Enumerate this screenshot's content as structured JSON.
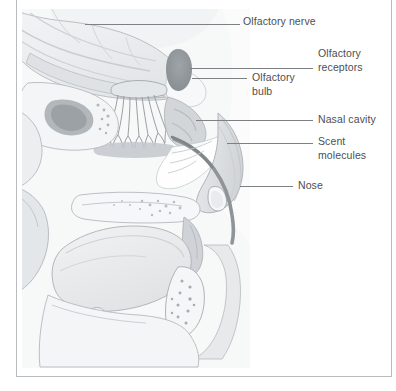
{
  "figure": {
    "frame_color": "#b9bcbe",
    "background_color": "#ffffff",
    "label_color": "#4c4f52",
    "leader_color": "#7d8184"
  },
  "labels": [
    {
      "id": "olfactory-nerve",
      "name": "olfactory-nerve",
      "lines": [
        "Olfactory nerve"
      ],
      "x": 243,
      "y": 15,
      "leader": {
        "x": 85,
        "y": 24,
        "width": 155
      }
    },
    {
      "id": "olfactory-receptors",
      "name": "olfactory-receptors",
      "lines": [
        "Olfactory",
        "receptors"
      ],
      "x": 318,
      "y": 47,
      "leader": {
        "x": 190,
        "y": 68,
        "width": 123
      }
    },
    {
      "id": "olfactory-bulb",
      "name": "olfactory-bulb",
      "lines": [
        "Olfactory",
        "bulb"
      ],
      "x": 252,
      "y": 71,
      "leader": {
        "x": 192,
        "y": 78,
        "width": 55
      }
    },
    {
      "id": "nasal-cavity",
      "name": "nasal-cavity",
      "lines": [
        "Nasal cavity"
      ],
      "x": 318,
      "y": 113,
      "leader": {
        "x": 196,
        "y": 120,
        "width": 117
      }
    },
    {
      "id": "scent-molecules",
      "name": "scent-molecules",
      "lines": [
        "Scent",
        "molecules"
      ],
      "x": 318,
      "y": 135,
      "leader": {
        "x": 227,
        "y": 143,
        "width": 86
      }
    },
    {
      "id": "nose",
      "name": "nose",
      "lines": [
        "Nose"
      ],
      "x": 298,
      "y": 179,
      "leader": {
        "x": 240,
        "y": 186,
        "width": 53
      }
    }
  ],
  "anatomy": {
    "palette": {
      "brain": "#eceef0",
      "brain_shade": "#d6d9dc",
      "bone": "#f4f5f6",
      "bone_shade": "#dcdfe2",
      "cavity": "#ffffff",
      "mucosa": "#c7cbce",
      "mucosa_dark": "#a9aeb2",
      "sinus_dark": "#8c9296",
      "tongue": "#e6e8ea",
      "outline": "#a7acb0",
      "soft_tissue": "#d9dcdf",
      "skin": "#e3e5e7"
    },
    "structures": [
      "cerebrum",
      "corpus-callosum",
      "olfactory-bulb",
      "olfactory-nerve-fibers",
      "cribriform-plate",
      "sphenoid-sinus",
      "nasal-turbinates",
      "nasal-cavity",
      "nostril",
      "nose-profile",
      "hard-palate",
      "soft-palate",
      "tongue",
      "uvula",
      "oral-cavity",
      "pharynx",
      "mandible",
      "cerebellum-brainstem"
    ]
  }
}
